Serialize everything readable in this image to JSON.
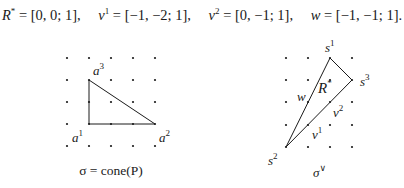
{
  "header": {
    "vectors": [
      {
        "name": "R",
        "sup": "*",
        "value": "[0, 0; 1],"
      },
      {
        "name": "v",
        "sup": "1",
        "value": "[−1, −2; 1],"
      },
      {
        "name": "v",
        "sup": "2",
        "value": "[0, −1; 1],"
      },
      {
        "name": "w",
        "sup": "",
        "value": "[−1, −1; 1]."
      }
    ]
  },
  "left_figure": {
    "caption": "σ = cone(P)",
    "labels": {
      "a1": {
        "base": "a",
        "sup": "1"
      },
      "a2": {
        "base": "a",
        "sup": "2"
      },
      "a3": {
        "base": "a",
        "sup": "3"
      }
    },
    "grid": {
      "cols": 5,
      "rows": 5
    },
    "triangle_vertices": [
      "a1",
      "a2",
      "a3"
    ]
  },
  "right_figure": {
    "caption": "σ",
    "caption_sup": "∨",
    "labels": {
      "s1": {
        "base": "s",
        "sup": "1"
      },
      "s2": {
        "base": "s",
        "sup": "2"
      },
      "s3": {
        "base": "s",
        "sup": "3"
      },
      "R": {
        "base": "R",
        "sup": "*"
      },
      "w": {
        "base": "w",
        "sup": ""
      },
      "v1": {
        "base": "v",
        "sup": "1"
      },
      "v2": {
        "base": "v",
        "sup": "2"
      }
    },
    "grid": {
      "cols": 4,
      "rows": 5
    },
    "triangle_vertices": [
      "s1",
      "s2",
      "s3"
    ]
  }
}
